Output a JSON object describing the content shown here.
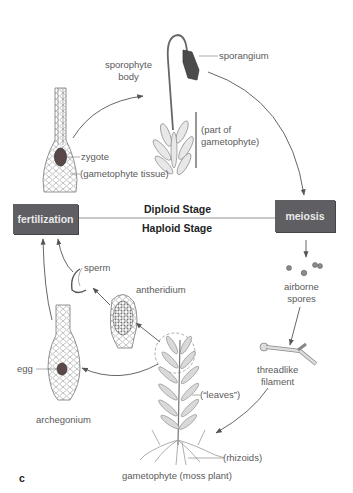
{
  "diagram": {
    "panel_letter": "c",
    "process_boxes": {
      "fertilization": "fertilization",
      "meiosis": "meiosis"
    },
    "stages": {
      "diploid": "Diploid Stage",
      "haploid": "Haploid Stage"
    },
    "labels": {
      "sporangium": "sporangium",
      "sporophyte_body_line1": "sporophyte",
      "sporophyte_body_line2": "body",
      "part_of_gametophyte_line1": "(part of",
      "part_of_gametophyte_line2": "gametophyte)",
      "zygote": "zygote",
      "gametophyte_tissue": "(gametophyte tissue)",
      "sperm": "sperm",
      "antheridium": "antheridium",
      "airborne_spores_line1": "airborne",
      "airborne_spores_line2": "spores",
      "threadlike_filament_line1": "threadlike",
      "threadlike_filament_line2": "filament",
      "egg": "egg",
      "archegonium": "archegonium",
      "leaves": "(“leaves”)",
      "rhizoids": "(rhizoids)",
      "gametophyte_moss_plant": "gametophyte (moss plant)"
    },
    "colors": {
      "box_fill": "#5f5f63",
      "box_text": "#eaeaea",
      "arrow": "#555555",
      "cell_dark": "#4a3a3a"
    }
  }
}
